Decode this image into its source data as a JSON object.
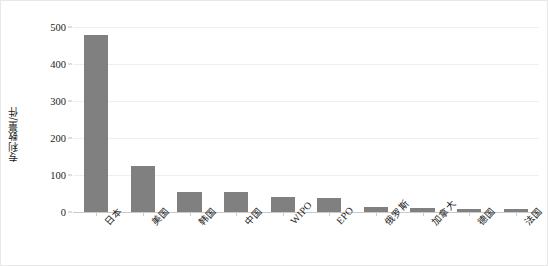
{
  "chart_data": {
    "type": "bar",
    "title": "",
    "subtitle": "",
    "xlabel": "",
    "ylabel": "专利数量/件",
    "ylim": [
      0,
      500
    ],
    "yticks": [
      0,
      100,
      200,
      300,
      400,
      500
    ],
    "ytick_labels": [
      "0",
      "100",
      "200",
      "300",
      "400",
      "500"
    ],
    "grid": true,
    "legend": null,
    "bar_color": "#808080",
    "categories": [
      "日本",
      "美国",
      "韩国",
      "中国",
      "WIPO",
      "EPO",
      "俄罗斯",
      "加拿大",
      "德国",
      "法国"
    ],
    "values": [
      478,
      125,
      54,
      53,
      41,
      38,
      14,
      12,
      8,
      7
    ],
    "series": [
      {
        "name": "专利数量",
        "values": [
          478,
          125,
          54,
          53,
          41,
          38,
          14,
          12,
          8,
          7
        ]
      }
    ]
  },
  "axes": {
    "y_title": "专利数量/件"
  }
}
